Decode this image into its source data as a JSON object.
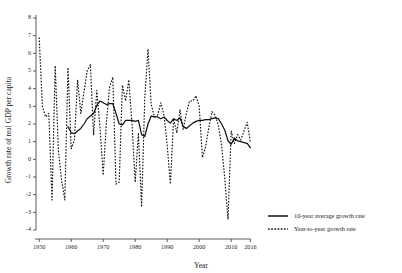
{
  "chart_data": {
    "type": "line",
    "title": "",
    "xlabel": "Year",
    "ylabel": "Growth rate of real GDP per capita",
    "xlim": [
      1949,
      2016.5
    ],
    "ylim": [
      -4,
      8
    ],
    "grid": false,
    "legend_position": "right",
    "xticks": [
      1950,
      1960,
      1970,
      1980,
      1990,
      2000,
      2010,
      2016
    ],
    "xtick_labels": [
      "1950",
      "1960",
      "1970",
      "1980",
      "1990",
      "2000",
      "2010",
      "2016"
    ],
    "yticks": [
      -4,
      -3,
      -2,
      -1,
      0,
      1,
      2,
      3,
      4,
      5,
      6,
      7,
      8
    ],
    "ytick_labels": [
      "-4",
      "-3",
      "-2",
      "-1",
      "0",
      "1",
      "2",
      "3",
      "4",
      "5",
      "6",
      "7",
      "8"
    ],
    "series": [
      {
        "name": "Year-to-year growth rate",
        "style": "dotted",
        "color": "#111111",
        "x": [
          1950,
          1951,
          1952,
          1953,
          1954,
          1955,
          1956,
          1957,
          1958,
          1959,
          1960,
          1961,
          1962,
          1963,
          1964,
          1965,
          1966,
          1967,
          1968,
          1969,
          1970,
          1971,
          1972,
          1973,
          1974,
          1975,
          1976,
          1977,
          1978,
          1979,
          1980,
          1981,
          1982,
          1983,
          1984,
          1985,
          1986,
          1987,
          1988,
          1989,
          1990,
          1991,
          1992,
          1993,
          1994,
          1995,
          1996,
          1997,
          1998,
          1999,
          2000,
          2001,
          2002,
          2003,
          2004,
          2005,
          2006,
          2007,
          2008,
          2009,
          2010,
          2011,
          2012,
          2013,
          2014,
          2015,
          2016
        ],
        "values": [
          6.9,
          3.0,
          2.4,
          2.6,
          -2.3,
          5.3,
          0.5,
          -1.2,
          -2.3,
          5.2,
          0.6,
          1.1,
          4.5,
          2.6,
          3.8,
          5.0,
          5.35,
          1.4,
          3.9,
          1.8,
          -0.9,
          2.1,
          4.1,
          4.65,
          -1.4,
          -1.3,
          4.2,
          3.3,
          4.5,
          2.0,
          -1.3,
          1.5,
          -2.7,
          3.5,
          6.25,
          3.1,
          2.4,
          2.5,
          3.2,
          2.5,
          0.8,
          -1.4,
          2.3,
          1.5,
          2.8,
          1.7,
          2.6,
          3.3,
          3.3,
          3.6,
          3.0,
          0.1,
          0.7,
          1.8,
          2.7,
          2.5,
          1.9,
          0.8,
          -1.1,
          -3.4,
          1.6,
          0.9,
          1.4,
          1.1,
          1.6,
          2.1,
          0.95
        ]
      },
      {
        "name": "10-year average growth rate",
        "style": "solid",
        "color": "#111111",
        "x": [
          1959,
          1960,
          1961,
          1962,
          1963,
          1964,
          1965,
          1966,
          1967,
          1968,
          1969,
          1970,
          1971,
          1972,
          1973,
          1974,
          1975,
          1976,
          1977,
          1978,
          1979,
          1980,
          1981,
          1982,
          1983,
          1984,
          1985,
          1986,
          1987,
          1988,
          1989,
          1990,
          1991,
          1992,
          1993,
          1994,
          1995,
          1996,
          1997,
          1998,
          1999,
          2000,
          2001,
          2002,
          2003,
          2004,
          2005,
          2006,
          2007,
          2008,
          2009,
          2010,
          2011,
          2012,
          2013,
          2014,
          2015,
          2016
        ],
        "values": [
          1.85,
          1.5,
          1.45,
          1.6,
          1.75,
          2.0,
          2.3,
          2.45,
          2.6,
          3.05,
          3.3,
          3.2,
          3.1,
          3.15,
          3.15,
          2.6,
          2.0,
          1.95,
          2.2,
          2.2,
          2.2,
          2.15,
          2.2,
          1.4,
          1.3,
          2.0,
          2.45,
          2.4,
          2.4,
          2.3,
          2.4,
          2.2,
          2.05,
          2.3,
          2.2,
          2.35,
          1.85,
          1.75,
          1.9,
          2.05,
          2.15,
          2.2,
          2.2,
          2.25,
          2.25,
          2.3,
          2.35,
          2.3,
          2.0,
          1.65,
          1.05,
          0.85,
          1.2,
          1.05,
          1.0,
          0.95,
          0.9,
          0.65
        ]
      }
    ]
  },
  "legend": {
    "entries": [
      {
        "label": "10-year average growth rate",
        "style": "solid"
      },
      {
        "label": "Year-to-year growth rate",
        "style": "dotted"
      }
    ]
  }
}
